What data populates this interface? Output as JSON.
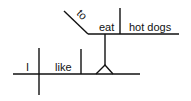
{
  "diagram": {
    "type": "sentence-diagram",
    "sentence": "I like to eat hot dogs",
    "subject": "I",
    "verb": "like",
    "infinitive_marker": "to",
    "infinitive_verb": "eat",
    "infinitive_object": "hot dogs",
    "line_color": "#111111"
  }
}
